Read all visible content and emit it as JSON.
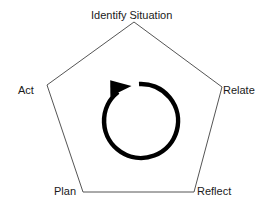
{
  "diagram": {
    "type": "cycle-pentagon",
    "stages": [
      {
        "id": "identify",
        "label": "Identify Situation",
        "position": "top"
      },
      {
        "id": "relate",
        "label": "Relate",
        "position": "right"
      },
      {
        "id": "reflect",
        "label": "Reflect",
        "position": "bottom-right"
      },
      {
        "id": "plan",
        "label": "Plan",
        "position": "bottom-left"
      },
      {
        "id": "act",
        "label": "Act",
        "position": "left"
      }
    ],
    "center_icon": "clockwise-cycle-arrow-icon",
    "colors": {
      "outline": "#555555",
      "arrow": "#000000",
      "text": "#1a1a1a",
      "background": "#ffffff"
    }
  }
}
